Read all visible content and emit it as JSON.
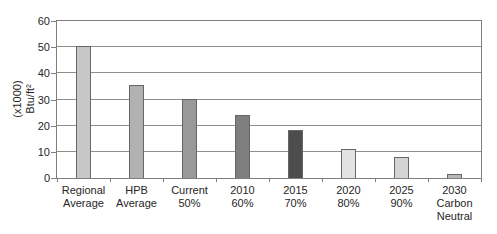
{
  "figure": {
    "title": "",
    "background": "#ffffff"
  },
  "colors": {
    "axis": "#7f7f7f",
    "grid": "#8f8f8f",
    "bar_border": "#666666",
    "text": "#262626"
  },
  "y_axis": {
    "title_lines": [
      "(x1000)",
      "Btu/ft²"
    ],
    "ticks": [
      0,
      10,
      20,
      30,
      40,
      50,
      60
    ]
  },
  "chart_data": {
    "type": "bar",
    "title": "",
    "xlabel": "",
    "ylabel": "(x1000) Btu/ft²",
    "ylim": [
      0,
      60
    ],
    "yticks": [
      0,
      10,
      20,
      30,
      40,
      50,
      60
    ],
    "grid": true,
    "legend": false,
    "categories": [
      "Regional Average",
      "HPB Average",
      "Current 50%",
      "2010 60%",
      "2015 70%",
      "2020 80%",
      "2025 90%",
      "2030 Carbon Neutral"
    ],
    "category_lines": [
      [
        "Regional",
        "Average"
      ],
      [
        "HPB",
        "Average"
      ],
      [
        "Current",
        "50%"
      ],
      [
        "2010",
        "60%"
      ],
      [
        "2015",
        "70%"
      ],
      [
        "2020",
        "80%"
      ],
      [
        "2025",
        "90%"
      ],
      [
        "2030",
        "Carbon",
        "Neutral"
      ]
    ],
    "values": [
      50.5,
      35.5,
      30,
      24,
      18.5,
      11,
      8,
      1.5
    ],
    "bar_colors": [
      "#c7c7c7",
      "#b2b2b2",
      "#999999",
      "#7f7f7f",
      "#4d4d4d",
      "#e2e2e2",
      "#d4d4d4",
      "#b8b8b8"
    ]
  }
}
